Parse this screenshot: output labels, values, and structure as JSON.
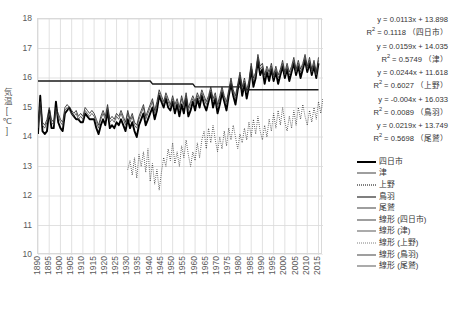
{
  "chart_data": {
    "type": "line",
    "title": "",
    "xlabel": "",
    "ylabel": "気温[℃]",
    "xlim": [
      1890,
      2017
    ],
    "ylim": [
      10,
      18
    ],
    "grid": true,
    "legend_position": "right",
    "x_tick_labels": [
      "1890",
      "1895",
      "1900",
      "1905",
      "1910",
      "1915",
      "1920",
      "1925",
      "1930",
      "1935",
      "1940",
      "1945",
      "1950",
      "1955",
      "1960",
      "1965",
      "1970",
      "1975",
      "1980",
      "1985",
      "1990",
      "1995",
      "2000",
      "2005",
      "2010",
      "2015"
    ],
    "y_tick_labels": [
      "18",
      "17",
      "16",
      "15",
      "14",
      "13",
      "12",
      "11",
      "10"
    ],
    "series": [
      {
        "name": "四日市",
        "style": "solid-thick",
        "x_start": 1890,
        "values": [
          14.1,
          15.4,
          14.2,
          14.1,
          14.2,
          14.9,
          14.3,
          14.3,
          15.2,
          14.5,
          14.3,
          14.2,
          14.8,
          14.9,
          15.0,
          14.8,
          14.7,
          14.6,
          14.6,
          14.5,
          14.5,
          14.8,
          14.7,
          14.6,
          14.6,
          14.6,
          14.3,
          14.1,
          14.4,
          14.6,
          14.4,
          14.9,
          14.3,
          14.4,
          14.3,
          14.5,
          14.4,
          14.6,
          14.4,
          14.2,
          14.6,
          14.3,
          14.5,
          14.2,
          14.0,
          14.4,
          14.6,
          14.8,
          14.4,
          14.6,
          14.8,
          15.0,
          14.6,
          14.9,
          15.4,
          15.2,
          15.0,
          15.3,
          15.0,
          14.9,
          15.2,
          14.8,
          15.1,
          14.7,
          15.1,
          14.8,
          15.3,
          14.7,
          14.9,
          15.2,
          14.9,
          15.3,
          15.0,
          15.4,
          15.1,
          14.9,
          15.2,
          15.5,
          15.0,
          15.3,
          14.8,
          15.1,
          15.5,
          15.2,
          14.9,
          15.4,
          15.8,
          15.4,
          15.1,
          15.6,
          16.0,
          15.4,
          15.8,
          15.3,
          15.7,
          16.3,
          15.7,
          16.0,
          16.6,
          16.1,
          16.3,
          15.8,
          16.2,
          15.9,
          16.3,
          15.9,
          16.2,
          15.8,
          16.1,
          16.4,
          16.0,
          16.3,
          15.9,
          16.2,
          16.5,
          16.1,
          16.4,
          16.0,
          16.3,
          16.6,
          16.2,
          16.5,
          16.1,
          16.4,
          16.0,
          16.5
        ]
      },
      {
        "name": "津",
        "style": "solid-thin",
        "x_start": 1890,
        "values": [
          14.3,
          15.0,
          14.4,
          14.3,
          14.5,
          14.8,
          14.5,
          14.4,
          14.9,
          14.7,
          14.5,
          14.4,
          14.9,
          15.0,
          14.9,
          14.8,
          14.7,
          14.8,
          14.6,
          14.7,
          14.6,
          14.9,
          14.8,
          14.7,
          14.8,
          14.7,
          14.5,
          14.3,
          14.6,
          14.8,
          14.6,
          15.0,
          14.5,
          14.6,
          14.5,
          14.7,
          14.6,
          14.8,
          14.6,
          14.4,
          14.8,
          14.5,
          14.7,
          14.4,
          14.3,
          14.6,
          14.8,
          15.0,
          14.6,
          14.8,
          15.0,
          15.2,
          14.8,
          15.1,
          15.5,
          15.3,
          15.1,
          15.4,
          15.2,
          15.0,
          15.3,
          15.0,
          15.2,
          14.9,
          15.3,
          15.0,
          15.4,
          14.9,
          15.1,
          15.3,
          15.1,
          15.4,
          15.2,
          15.5,
          15.3,
          15.1,
          15.3,
          15.6,
          15.2,
          15.4,
          15.0,
          15.3,
          15.6,
          15.3,
          15.1,
          15.5,
          15.9,
          15.5,
          15.3,
          15.7,
          16.1,
          15.6,
          15.9,
          15.5,
          15.8,
          16.4,
          15.9,
          16.1,
          16.7,
          16.3,
          16.4,
          16.0,
          16.3,
          16.1,
          16.4,
          16.0,
          16.3,
          16.0,
          16.2,
          16.5,
          16.1,
          16.4,
          16.1,
          16.3,
          16.6,
          16.2,
          16.5,
          16.2,
          16.4,
          16.7,
          16.3,
          16.6,
          16.2,
          16.5,
          16.1,
          16.6
        ]
      },
      {
        "name": "上野",
        "style": "dotted",
        "x_start": 1930,
        "values": [
          12.9,
          13.2,
          12.7,
          13.3,
          12.6,
          13.4,
          13.0,
          13.5,
          12.8,
          13.6,
          12.5,
          13.1,
          12.4,
          12.9,
          12.2,
          12.8,
          13.3,
          13.0,
          13.6,
          13.2,
          13.8,
          13.1,
          13.5,
          13.0,
          13.7,
          13.3,
          13.9,
          13.4,
          13.0,
          13.5,
          13.2,
          13.8,
          13.3,
          13.9,
          14.2,
          13.6,
          14.3,
          13.8,
          14.4,
          13.9,
          13.5,
          14.0,
          13.6,
          14.2,
          13.7,
          14.3,
          13.9,
          14.4,
          14.0,
          13.6,
          14.1,
          13.8,
          14.3,
          13.9,
          14.5,
          14.0,
          14.6,
          14.1,
          14.7,
          14.2,
          13.9,
          14.4,
          14.0,
          14.6,
          14.2,
          14.8,
          14.3,
          14.9,
          14.4,
          15.0,
          14.5,
          14.2,
          14.7,
          14.3,
          14.9,
          14.4,
          15.0,
          14.6,
          15.1,
          14.7,
          14.4,
          14.9,
          14.5,
          15.0,
          14.6,
          15.2,
          14.8,
          15.3,
          14.9,
          15.1
        ]
      },
      {
        "name": "鳥羽",
        "style": "solid-med",
        "x_start": 1890,
        "values": [
          15.9,
          15.9,
          15.9,
          15.9,
          15.9,
          15.9,
          15.9,
          15.9,
          15.9,
          15.9,
          15.9,
          15.9,
          15.9,
          15.9,
          15.9,
          15.9,
          15.9,
          15.9,
          15.9,
          15.9,
          15.9,
          15.9,
          15.9,
          15.9,
          15.9,
          15.9,
          15.9,
          15.9,
          15.9,
          15.9,
          15.9,
          15.9,
          15.9,
          15.9,
          15.9,
          15.9,
          15.9,
          15.9,
          15.9,
          15.9,
          15.9,
          15.9,
          15.9,
          15.9,
          15.9,
          15.9,
          15.9,
          15.9,
          15.9,
          15.9,
          15.9,
          15.8,
          15.8,
          15.8,
          15.8,
          15.8,
          15.8,
          15.8,
          15.8,
          15.8,
          15.8,
          15.8,
          15.8,
          15.8,
          15.8,
          15.8,
          15.8,
          15.8,
          15.8,
          15.8,
          15.7,
          15.7,
          15.7,
          15.7,
          15.7,
          15.7,
          15.7,
          15.7,
          15.7,
          15.7,
          15.7,
          15.7,
          15.7,
          15.7,
          15.7,
          15.7,
          15.7,
          15.7,
          15.7,
          15.7,
          15.7,
          15.6,
          15.6,
          15.6,
          15.6,
          15.6,
          15.6,
          15.6,
          15.6,
          15.6,
          15.6,
          15.6,
          15.6,
          15.6,
          15.6,
          15.6,
          15.6,
          15.6,
          15.6,
          15.6,
          15.6,
          15.6,
          15.6,
          15.6,
          15.6,
          15.6,
          15.6,
          15.6,
          15.6,
          15.6,
          15.6,
          15.6,
          15.6,
          15.6,
          15.6,
          15.6
        ]
      },
      {
        "name": "尾鷲",
        "style": "solid-thin2",
        "x_start": 1890,
        "values": [
          14.4,
          15.2,
          14.5,
          14.4,
          14.6,
          15.0,
          14.6,
          14.5,
          15.0,
          14.8,
          14.6,
          14.5,
          15.0,
          15.1,
          15.0,
          14.9,
          14.8,
          14.9,
          14.7,
          14.8,
          14.7,
          15.0,
          14.9,
          14.8,
          14.9,
          14.8,
          14.6,
          14.4,
          14.7,
          14.9,
          14.7,
          15.1,
          14.6,
          14.7,
          14.6,
          14.8,
          14.7,
          14.9,
          14.7,
          14.5,
          14.9,
          14.6,
          14.8,
          14.5,
          14.4,
          14.7,
          14.9,
          15.1,
          14.7,
          14.9,
          15.1,
          15.3,
          14.9,
          15.2,
          15.6,
          15.4,
          15.2,
          15.5,
          15.3,
          15.1,
          15.4,
          15.1,
          15.3,
          15.0,
          15.4,
          15.1,
          15.5,
          15.0,
          15.2,
          15.4,
          15.2,
          15.5,
          15.3,
          15.6,
          15.4,
          15.2,
          15.4,
          15.7,
          15.3,
          15.5,
          15.1,
          15.4,
          15.7,
          15.4,
          15.2,
          15.6,
          16.0,
          15.6,
          15.4,
          15.8,
          16.2,
          15.7,
          16.0,
          15.6,
          15.9,
          16.5,
          16.0,
          16.2,
          16.8,
          16.4,
          16.5,
          16.1,
          16.4,
          16.2,
          16.5,
          16.1,
          16.4,
          16.1,
          16.3,
          16.6,
          16.2,
          16.5,
          16.2,
          16.4,
          16.7,
          16.3,
          16.6,
          16.3,
          16.5,
          16.8,
          16.4,
          16.7,
          16.3,
          16.6,
          16.2,
          16.7
        ]
      }
    ],
    "trendlines": [
      {
        "name": "線形 (四日市)",
        "slope": 0.0113,
        "intercept": 13.898,
        "r2": 0.1118,
        "style": "solid-thick",
        "x_start": 1890,
        "x_end": 2016
      },
      {
        "name": "線形 (津)",
        "slope": 0.0159,
        "intercept": 14.035,
        "r2": 0.5749,
        "style": "solid-thin",
        "x_start": 1890,
        "x_end": 2016
      },
      {
        "name": "線形 (上野)",
        "slope": 0.0244,
        "intercept": 11.618,
        "r2": 0.6027,
        "style": "dotted",
        "x_start": 1930,
        "x_end": 2016
      },
      {
        "name": "線形 (鳥羽)",
        "slope": -0.004,
        "intercept": 16.033,
        "r2": 0.0089,
        "style": "solid-med",
        "x_start": 1890,
        "x_end": 2016
      },
      {
        "name": "線形 (尾鷲)",
        "slope": 0.0219,
        "intercept": 13.749,
        "r2": 0.5698,
        "style": "solid-thin2",
        "x_start": 1890,
        "x_end": 2016
      }
    ],
    "annotations": [
      {
        "equation": "y = 0.0113x + 13.898",
        "r2": "R2 = 0.1118",
        "station": "（四日市）"
      },
      {
        "equation": "y = 0.0159x + 14.035",
        "r2": "R2 = 0.5749",
        "station": "（津）"
      },
      {
        "equation": "y = 0.0244x + 11.618",
        "r2": "R2 = 0.6027",
        "station": "（上野）"
      },
      {
        "equation": "y = -0.004x + 16.033",
        "r2": "R2 = 0.0089",
        "station": "（鳥羽）"
      },
      {
        "equation": "y = 0.0219x + 13.749",
        "r2": "R2 = 0.5698",
        "station": "（尾鷲）"
      }
    ],
    "legend_entries": [
      {
        "label": "四日市",
        "style": "sw-thick"
      },
      {
        "label": "津",
        "style": "sw-thin"
      },
      {
        "label": "上野",
        "style": "sw-dot"
      },
      {
        "label": "鳥羽",
        "style": "sw-med"
      },
      {
        "label": "尾鷲",
        "style": "sw-thin"
      },
      {
        "label": "線形 (四日市)",
        "style": "sw-trend-thick"
      },
      {
        "label": "線形 (津)",
        "style": "sw-trend"
      },
      {
        "label": "線形 (上野)",
        "style": "sw-trend-dot"
      },
      {
        "label": "線形 (鳥羽)",
        "style": "sw-trend-thick"
      },
      {
        "label": "線形 (尾鷲)",
        "style": "sw-trend"
      }
    ],
    "colors": {
      "axis_text": "#595959",
      "grid": "#d9d9d9",
      "series_primary": "#000000",
      "plot_background": "#ffffff"
    }
  }
}
